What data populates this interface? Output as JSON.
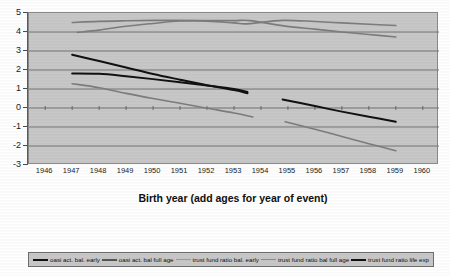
{
  "chart_data": {
    "type": "line",
    "title": "",
    "xlabel": "Birth year (add ages for year of event)",
    "ylabel": "",
    "xlim": [
      1945.4,
      1960.6
    ],
    "ylim": [
      -3,
      5
    ],
    "grid": true,
    "legend_position": "bottom",
    "x_ticks": [
      1946,
      1947,
      1948,
      1949,
      1950,
      1951,
      1952,
      1953,
      1954,
      1955,
      1956,
      1957,
      1958,
      1959,
      1960
    ],
    "y_ticks": [
      5,
      4,
      3,
      2,
      1,
      0,
      -1,
      -2,
      -3
    ],
    "plot_background": "#c8c8c8",
    "series": [
      {
        "name": "oasi act. bal. early",
        "color": "#111111",
        "width": 2.0,
        "points": [
          [
            1947.0,
            2.8
          ],
          [
            1948.0,
            2.47
          ],
          [
            1949.0,
            2.13
          ],
          [
            1950.0,
            1.79
          ],
          [
            1951.0,
            1.49
          ],
          [
            1952.0,
            1.2
          ],
          [
            1953.0,
            0.94
          ],
          [
            1953.5,
            0.78
          ]
        ]
      },
      {
        "name": "oasi act. bal full age",
        "color": "#111111",
        "width": 2.0,
        "points": [
          [
            1947.0,
            1.82
          ],
          [
            1948.0,
            1.8
          ],
          [
            1949.0,
            1.67
          ],
          [
            1950.0,
            1.52
          ],
          [
            1951.0,
            1.36
          ],
          [
            1952.0,
            1.19
          ],
          [
            1953.0,
            1.0
          ],
          [
            1953.5,
            0.84
          ]
        ]
      },
      {
        "name": "trust fund ratio bal. early",
        "color": "#7d7d7d",
        "width": 1.6,
        "points": [
          [
            1947.0,
            4.5
          ],
          [
            1948.0,
            4.56
          ],
          [
            1949.0,
            4.59
          ],
          [
            1950.0,
            4.61
          ],
          [
            1951.0,
            4.61
          ],
          [
            1952.0,
            4.57
          ],
          [
            1953.0,
            4.48
          ],
          [
            1953.5,
            4.43
          ],
          [
            1954.8,
            4.61
          ],
          [
            1956.0,
            4.55
          ],
          [
            1957.0,
            4.48
          ],
          [
            1958.0,
            4.41
          ],
          [
            1959.0,
            4.34
          ]
        ]
      },
      {
        "name": "trust fund ratio bal full age",
        "color": "#7d7d7d",
        "width": 1.6,
        "points": [
          [
            1947.2,
            3.98
          ],
          [
            1948.0,
            4.1
          ],
          [
            1949.0,
            4.3
          ],
          [
            1950.0,
            4.45
          ],
          [
            1951.0,
            4.58
          ],
          [
            1952.0,
            4.6
          ],
          [
            1953.0,
            4.6
          ],
          [
            1953.6,
            4.6
          ],
          [
            1954.9,
            4.31
          ],
          [
            1956.0,
            4.15
          ],
          [
            1957.0,
            4.0
          ],
          [
            1958.0,
            3.87
          ],
          [
            1959.0,
            3.74
          ]
        ]
      },
      {
        "name": "trust fund ratio life exp",
        "color": "#111111",
        "width": 2.0,
        "points": [
          [
            1954.8,
            0.45
          ],
          [
            1956.0,
            0.1
          ],
          [
            1957.0,
            -0.19
          ],
          [
            1958.0,
            -0.46
          ],
          [
            1959.0,
            -0.72
          ]
        ]
      },
      {
        "name": "trust fund ratio bal. early lower",
        "color": "#7d7d7d",
        "width": 1.6,
        "points": [
          [
            1947.0,
            1.28
          ],
          [
            1948.0,
            1.07
          ],
          [
            1949.0,
            0.77
          ],
          [
            1950.0,
            0.5
          ],
          [
            1951.0,
            0.25
          ],
          [
            1952.0,
            -0.01
          ],
          [
            1953.0,
            -0.26
          ],
          [
            1953.7,
            -0.47
          ]
        ]
      },
      {
        "name": "trust fund ratio bal full age lower",
        "color": "#7d7d7d",
        "width": 1.6,
        "points": [
          [
            1954.9,
            -0.72
          ],
          [
            1956.0,
            -1.12
          ],
          [
            1957.0,
            -1.5
          ],
          [
            1958.0,
            -1.88
          ],
          [
            1959.0,
            -2.25
          ]
        ]
      }
    ]
  },
  "legend": {
    "items": [
      {
        "label": "oasi act. bal. early",
        "color": "#111111",
        "width": 2.2
      },
      {
        "label": "oasi act. bal full age",
        "color": "#555555",
        "width": 2.0
      },
      {
        "label": "trust fund ratio bal. early",
        "color": "#9a9a9a",
        "width": 1.4
      },
      {
        "label": "trust fund ratio bal full age",
        "color": "#8a8a8a",
        "width": 1.6
      },
      {
        "label": "trust fund ratio life exp",
        "color": "#111111",
        "width": 2.4
      }
    ]
  },
  "axis": {
    "x_title": "Birth year (add ages for year of event)"
  }
}
